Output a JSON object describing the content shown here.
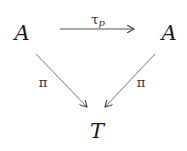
{
  "diagram": {
    "type": "commutative-diagram",
    "nodes": {
      "top_left": "A",
      "top_right": "A",
      "bottom": "T"
    },
    "arrows": {
      "top": {
        "from": "A",
        "to": "A",
        "label_main": "τ",
        "label_sub": "p"
      },
      "left_diag": {
        "from": "A",
        "to": "T",
        "label": "π"
      },
      "right_diag": {
        "from": "A",
        "to": "T",
        "label": "π"
      }
    },
    "colors": {
      "ink": "#1a1a1a",
      "arrow": "#555555",
      "background": "#ffffff"
    }
  }
}
